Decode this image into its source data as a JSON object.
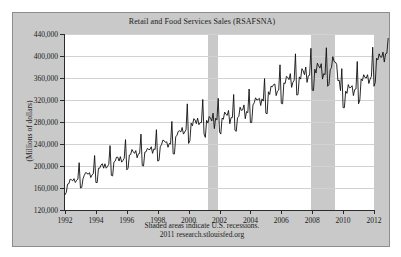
{
  "figure": {
    "background": "#ffffff",
    "panel_background": "#c9c9c9",
    "panel_border": "#8d8d8d",
    "plot_background": "#ffffff",
    "axis_color": "#2b2b2b",
    "grid_color": "#d2d2d2",
    "series_color": "#111111",
    "recession_color": "#c9c9c9"
  },
  "footnote": {
    "line1": "Shaded areas indicate U.S. recessions.",
    "line2": "2011 research.stlouisfed.org"
  },
  "chart_data": {
    "type": "line",
    "title": "Retail and Food Services Sales (RSAFSNA)",
    "xlabel": "",
    "ylabel": "(Millions of dollars)",
    "grid": true,
    "legend": null,
    "xlim": [
      1992.0,
      2012.0
    ],
    "ylim": [
      120000,
      440000
    ],
    "ytick_values": [
      120000,
      160000,
      200000,
      240000,
      280000,
      320000,
      360000,
      400000,
      440000
    ],
    "ytick_labels": [
      "120,000",
      "160,000",
      "200,000",
      "240,000",
      "280,000",
      "320,000",
      "360,000",
      "400,000",
      "440,000"
    ],
    "xtick_values": [
      1992,
      1994,
      1996,
      1998,
      2000,
      2002,
      2004,
      2006,
      2008,
      2010,
      2012
    ],
    "xtick_labels": [
      "1992",
      "1994",
      "1996",
      "1998",
      "2000",
      "2002",
      "2004",
      "2006",
      "2008",
      "2010",
      "2012"
    ],
    "annotations": [
      {
        "label": "Shaded areas indicate U.S. recessions.",
        "kind": "footnote"
      },
      {
        "label": "2011 research.stlouisfed.org",
        "kind": "source"
      }
    ],
    "shaded_regions": [
      {
        "name": "recession-2001",
        "x_start": 2001.25,
        "x_end": 2001.92
      },
      {
        "name": "recession-2008",
        "x_start": 2007.92,
        "x_end": 2009.5
      }
    ],
    "series": [
      {
        "name": "Retail and Food Services Sales",
        "units": "Millions of dollars",
        "frequency": "Monthly",
        "x_start": 1992.0,
        "x_step": 0.0833333,
        "values": [
          148000,
          152000,
          167000,
          168000,
          176000,
          175000,
          173000,
          177000,
          170000,
          174000,
          176000,
          206000,
          160000,
          161000,
          177000,
          183000,
          188000,
          187000,
          185000,
          188000,
          179000,
          184000,
          186000,
          219000,
          170000,
          170000,
          196000,
          196000,
          202000,
          204000,
          196000,
          204000,
          196000,
          199000,
          203000,
          237000,
          183000,
          182000,
          207000,
          209000,
          216000,
          216000,
          209000,
          217000,
          207000,
          210000,
          214000,
          248000,
          193000,
          196000,
          220000,
          221000,
          230000,
          226000,
          223000,
          228000,
          215000,
          222000,
          223000,
          258000,
          201000,
          200000,
          225000,
          226000,
          232000,
          230000,
          230000,
          235000,
          223000,
          231000,
          230000,
          266000,
          209000,
          210000,
          235000,
          239000,
          247000,
          246000,
          243000,
          244000,
          234000,
          241000,
          240000,
          281000,
          222000,
          222000,
          253000,
          256000,
          263000,
          264000,
          262000,
          270000,
          258000,
          262000,
          266000,
          313000,
          241000,
          246000,
          278000,
          273000,
          286000,
          284000,
          277000,
          287000,
          275000,
          279000,
          279000,
          321000,
          258000,
          252000,
          283000,
          278000,
          290000,
          287000,
          282000,
          296000,
          268000,
          287000,
          284000,
          323000,
          262000,
          258000,
          287000,
          285000,
          298000,
          294000,
          292000,
          301000,
          277000,
          288000,
          288000,
          330000,
          265000,
          263000,
          288000,
          290000,
          307000,
          301000,
          302000,
          311000,
          286000,
          299000,
          297000,
          340000,
          279000,
          279000,
          311000,
          315000,
          324000,
          320000,
          321000,
          323000,
          310000,
          322000,
          318000,
          359000,
          296000,
          295000,
          335000,
          330000,
          345000,
          344000,
          348000,
          349000,
          328000,
          336000,
          338000,
          384000,
          314000,
          313000,
          351000,
          350000,
          363000,
          361000,
          357000,
          368000,
          343000,
          352000,
          356000,
          404000,
          329000,
          330000,
          362000,
          358000,
          377000,
          373000,
          366000,
          380000,
          352000,
          364000,
          365000,
          414000,
          338000,
          337000,
          376000,
          369000,
          387000,
          382000,
          378000,
          386000,
          358000,
          368000,
          366000,
          415000,
          345000,
          348000,
          375000,
          379000,
          399000,
          390000,
          389000,
          385000,
          355000,
          356000,
          337000,
          377000,
          306000,
          306000,
          336000,
          332000,
          348000,
          342000,
          343000,
          346000,
          328000,
          339000,
          340000,
          390000,
          313000,
          320000,
          358000,
          355000,
          366000,
          361000,
          360000,
          366000,
          350000,
          358000,
          363000,
          416000,
          345000,
          352000,
          396000,
          393000,
          404000,
          398000,
          398000,
          407000,
          389000,
          404000,
          405000,
          432000
        ]
      }
    ]
  }
}
